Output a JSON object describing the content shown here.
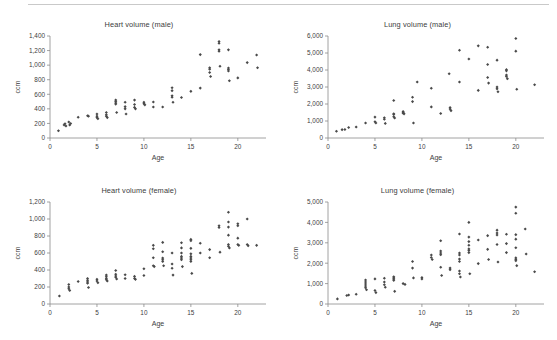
{
  "figure": {
    "background_color": "#ffffff",
    "rule_color": "#c9c9c9",
    "marker_color": "#4a4a4a",
    "axis_color": "#8c8c8c",
    "text_color": "#3c3c3c"
  },
  "panels": [
    {
      "id": "heart-male",
      "title": "Heart volume (male)",
      "xlabel": "Age",
      "ylabel": "ccm"
    },
    {
      "id": "lung-male",
      "title": "Lung volume (male)",
      "xlabel": "Age",
      "ylabel": "ccm"
    },
    {
      "id": "heart-female",
      "title": "Heart volume (female)",
      "xlabel": "Age",
      "ylabel": "ccm"
    },
    {
      "id": "lung-female",
      "title": "Lung volume (female)",
      "xlabel": "Age",
      "ylabel": "ccm"
    }
  ],
  "chart_data": [
    {
      "type": "scatter",
      "id": "heart-male",
      "title": "Heart volume (male)",
      "xlabel": "Age",
      "ylabel": "ccm",
      "xlim": [
        0,
        23
      ],
      "ylim": [
        0,
        1400
      ],
      "xticks": [
        0,
        5,
        10,
        15,
        20
      ],
      "yticks": [
        0,
        200,
        400,
        600,
        800,
        1000,
        1200,
        1400
      ],
      "ytick_labels": [
        "0",
        "200",
        "400",
        "600",
        "800",
        "1,000",
        "1,200",
        "1,400"
      ],
      "xtick_labels": [
        "0",
        "5",
        "10",
        "15",
        "20"
      ],
      "grid": false,
      "legend": "none",
      "marker": "diamond",
      "points": [
        [
          0.9,
          100
        ],
        [
          1.5,
          180
        ],
        [
          1.6,
          195
        ],
        [
          1.7,
          165
        ],
        [
          2.0,
          220
        ],
        [
          2.1,
          180
        ],
        [
          2.2,
          200
        ],
        [
          3.0,
          285
        ],
        [
          4.0,
          305
        ],
        [
          4.1,
          300
        ],
        [
          5.0,
          330
        ],
        [
          5.0,
          300
        ],
        [
          5.0,
          280
        ],
        [
          5.1,
          265
        ],
        [
          6.0,
          350
        ],
        [
          6.0,
          320
        ],
        [
          6.0,
          300
        ],
        [
          6.1,
          280
        ],
        [
          7.0,
          520
        ],
        [
          7.0,
          500
        ],
        [
          7.0,
          480
        ],
        [
          7.0,
          465
        ],
        [
          7.1,
          350
        ],
        [
          8.0,
          490
        ],
        [
          8.0,
          430
        ],
        [
          8.0,
          400
        ],
        [
          8.1,
          330
        ],
        [
          9.0,
          520
        ],
        [
          9.0,
          460
        ],
        [
          9.0,
          420
        ],
        [
          9.1,
          400
        ],
        [
          10.0,
          490
        ],
        [
          10.0,
          470
        ],
        [
          10.1,
          455
        ],
        [
          11.0,
          495
        ],
        [
          11.0,
          425
        ],
        [
          12.0,
          425
        ],
        [
          13.0,
          690
        ],
        [
          13.0,
          650
        ],
        [
          13.0,
          580
        ],
        [
          13.0,
          560
        ],
        [
          13.1,
          490
        ],
        [
          14.0,
          555
        ],
        [
          15.0,
          640
        ],
        [
          16.0,
          685
        ],
        [
          16.0,
          1145
        ],
        [
          17.0,
          965
        ],
        [
          17.0,
          945
        ],
        [
          17.0,
          900
        ],
        [
          17.1,
          845
        ],
        [
          18.0,
          1325
        ],
        [
          18.0,
          1300
        ],
        [
          18.0,
          1210
        ],
        [
          18.0,
          1190
        ],
        [
          18.1,
          985
        ],
        [
          19.0,
          1210
        ],
        [
          19.0,
          960
        ],
        [
          19.0,
          940
        ],
        [
          19.0,
          920
        ],
        [
          19.1,
          785
        ],
        [
          20.0,
          825
        ],
        [
          21.0,
          1035
        ],
        [
          22.0,
          1140
        ],
        [
          22.1,
          965
        ]
      ]
    },
    {
      "type": "scatter",
      "id": "lung-male",
      "title": "Lung volume (male)",
      "xlabel": "Age",
      "ylabel": "ccm",
      "xlim": [
        0,
        23
      ],
      "ylim": [
        0,
        6000
      ],
      "xticks": [
        0,
        5,
        10,
        15,
        20
      ],
      "yticks": [
        0,
        1000,
        2000,
        3000,
        4000,
        5000,
        6000
      ],
      "ytick_labels": [
        "0",
        "1,000",
        "2,000",
        "3,000",
        "4,000",
        "5,000",
        "6,000"
      ],
      "xtick_labels": [
        "0",
        "5",
        "10",
        "15",
        "20"
      ],
      "grid": false,
      "legend": "none",
      "marker": "diamond",
      "points": [
        [
          0.9,
          400
        ],
        [
          1.5,
          490
        ],
        [
          1.8,
          500
        ],
        [
          2.2,
          620
        ],
        [
          3.0,
          650
        ],
        [
          4.0,
          880
        ],
        [
          5.0,
          1230
        ],
        [
          5.0,
          960
        ],
        [
          5.1,
          880
        ],
        [
          6.0,
          1190
        ],
        [
          6.0,
          1100
        ],
        [
          6.1,
          860
        ],
        [
          7.0,
          2210
        ],
        [
          7.0,
          1430
        ],
        [
          7.0,
          1380
        ],
        [
          7.0,
          1250
        ],
        [
          7.1,
          1180
        ],
        [
          8.0,
          1560
        ],
        [
          8.0,
          1500
        ],
        [
          8.0,
          1460
        ],
        [
          8.1,
          1420
        ],
        [
          9.0,
          2400
        ],
        [
          9.0,
          2140
        ],
        [
          9.1,
          880
        ],
        [
          9.5,
          3290
        ],
        [
          11.0,
          2930
        ],
        [
          11.0,
          1830
        ],
        [
          12.0,
          1440
        ],
        [
          12.9,
          3780
        ],
        [
          13.0,
          1790
        ],
        [
          13.0,
          1700
        ],
        [
          13.1,
          1610
        ],
        [
          14.0,
          5160
        ],
        [
          14.0,
          3290
        ],
        [
          15.0,
          4650
        ],
        [
          16.0,
          5420
        ],
        [
          16.0,
          2800
        ],
        [
          17.0,
          5340
        ],
        [
          17.0,
          4320
        ],
        [
          17.0,
          3560
        ],
        [
          17.1,
          3230
        ],
        [
          18.0,
          4580
        ],
        [
          18.0,
          3000
        ],
        [
          18.0,
          2890
        ],
        [
          18.1,
          2720
        ],
        [
          19.0,
          4020
        ],
        [
          19.0,
          3950
        ],
        [
          19.0,
          3700
        ],
        [
          19.0,
          3620
        ],
        [
          19.1,
          3490
        ],
        [
          20.0,
          5850
        ],
        [
          20.0,
          5110
        ],
        [
          20.1,
          2870
        ],
        [
          22.0,
          3130
        ]
      ]
    },
    {
      "type": "scatter",
      "id": "heart-female",
      "title": "Heart volume (female)",
      "xlabel": "Age",
      "ylabel": "ccm",
      "xlim": [
        0,
        23
      ],
      "ylim": [
        0,
        1200
      ],
      "xticks": [
        0,
        5,
        10,
        15,
        20
      ],
      "yticks": [
        0,
        200,
        400,
        600,
        800,
        1000,
        1200
      ],
      "ytick_labels": [
        "0",
        "200",
        "400",
        "600",
        "800",
        "1,000",
        "1,200"
      ],
      "xtick_labels": [
        "0",
        "5",
        "10",
        "15",
        "20"
      ],
      "grid": false,
      "legend": "none",
      "marker": "diamond",
      "points": [
        [
          1.0,
          95
        ],
        [
          2.0,
          230
        ],
        [
          2.0,
          200
        ],
        [
          2.0,
          180
        ],
        [
          2.1,
          160
        ],
        [
          3.0,
          265
        ],
        [
          4.0,
          300
        ],
        [
          4.0,
          280
        ],
        [
          4.0,
          260
        ],
        [
          4.0,
          245
        ],
        [
          4.1,
          195
        ],
        [
          5.0,
          290
        ],
        [
          5.0,
          270
        ],
        [
          5.1,
          250
        ],
        [
          6.0,
          340
        ],
        [
          6.0,
          320
        ],
        [
          6.0,
          300
        ],
        [
          6.0,
          285
        ],
        [
          6.1,
          270
        ],
        [
          7.0,
          395
        ],
        [
          7.0,
          350
        ],
        [
          7.0,
          330
        ],
        [
          7.0,
          315
        ],
        [
          7.1,
          295
        ],
        [
          8.0,
          345
        ],
        [
          8.0,
          300
        ],
        [
          9.0,
          325
        ],
        [
          9.0,
          300
        ],
        [
          9.1,
          290
        ],
        [
          10.0,
          415
        ],
        [
          10.0,
          335
        ],
        [
          11.0,
          690
        ],
        [
          11.0,
          650
        ],
        [
          11.0,
          545
        ],
        [
          11.0,
          450
        ],
        [
          11.1,
          440
        ],
        [
          12.0,
          725
        ],
        [
          12.0,
          615
        ],
        [
          12.0,
          540
        ],
        [
          12.0,
          520
        ],
        [
          12.0,
          500
        ],
        [
          12.1,
          450
        ],
        [
          13.0,
          600
        ],
        [
          13.0,
          470
        ],
        [
          13.0,
          420
        ],
        [
          13.1,
          340
        ],
        [
          14.0,
          720
        ],
        [
          14.0,
          660
        ],
        [
          14.0,
          600
        ],
        [
          14.0,
          560
        ],
        [
          14.0,
          540
        ],
        [
          14.0,
          520
        ],
        [
          14.1,
          440
        ],
        [
          15.0,
          760
        ],
        [
          15.0,
          745
        ],
        [
          15.0,
          655
        ],
        [
          15.0,
          590
        ],
        [
          15.0,
          560
        ],
        [
          15.0,
          540
        ],
        [
          15.0,
          520
        ],
        [
          15.0,
          500
        ],
        [
          15.1,
          360
        ],
        [
          16.0,
          715
        ],
        [
          16.0,
          600
        ],
        [
          17.0,
          640
        ],
        [
          17.0,
          545
        ],
        [
          18.0,
          920
        ],
        [
          18.0,
          900
        ],
        [
          18.1,
          610
        ],
        [
          19.0,
          1080
        ],
        [
          19.0,
          965
        ],
        [
          19.0,
          905
        ],
        [
          19.0,
          810
        ],
        [
          19.0,
          700
        ],
        [
          19.0,
          680
        ],
        [
          19.1,
          660
        ],
        [
          20.0,
          945
        ],
        [
          20.0,
          920
        ],
        [
          20.0,
          775
        ],
        [
          20.0,
          700
        ],
        [
          20.1,
          690
        ],
        [
          21.0,
          1000
        ],
        [
          21.0,
          700
        ],
        [
          21.1,
          685
        ],
        [
          22.0,
          690
        ]
      ]
    },
    {
      "type": "scatter",
      "id": "lung-female",
      "title": "Lung volume (female)",
      "xlabel": "Age",
      "ylabel": "ccm",
      "xlim": [
        0,
        23
      ],
      "ylim": [
        0,
        5000
      ],
      "xticks": [
        0,
        5,
        10,
        15,
        20
      ],
      "yticks": [
        0,
        1000,
        2000,
        3000,
        4000,
        5000
      ],
      "ytick_labels": [
        "0",
        "1,000",
        "2,000",
        "3,000",
        "4,000",
        "5,000"
      ],
      "xtick_labels": [
        "0",
        "5",
        "10",
        "15",
        "20"
      ],
      "grid": false,
      "legend": "none",
      "marker": "diamond",
      "points": [
        [
          1.0,
          250
        ],
        [
          2.0,
          420
        ],
        [
          2.2,
          440
        ],
        [
          3.0,
          480
        ],
        [
          4.0,
          1180
        ],
        [
          4.0,
          1080
        ],
        [
          4.0,
          980
        ],
        [
          4.0,
          880
        ],
        [
          4.0,
          800
        ],
        [
          4.1,
          700
        ],
        [
          5.0,
          1230
        ],
        [
          5.0,
          660
        ],
        [
          5.1,
          560
        ],
        [
          6.0,
          1260
        ],
        [
          6.0,
          1080
        ],
        [
          6.0,
          940
        ],
        [
          6.1,
          820
        ],
        [
          7.0,
          1330
        ],
        [
          7.0,
          1280
        ],
        [
          7.0,
          1220
        ],
        [
          7.0,
          1160
        ],
        [
          7.1,
          620
        ],
        [
          8.0,
          1000
        ],
        [
          8.2,
          960
        ],
        [
          9.0,
          2080
        ],
        [
          9.0,
          1760
        ],
        [
          9.1,
          1280
        ],
        [
          10.0,
          1300
        ],
        [
          10.0,
          1230
        ],
        [
          11.0,
          2400
        ],
        [
          11.0,
          2280
        ],
        [
          11.1,
          2180
        ],
        [
          12.0,
          3100
        ],
        [
          12.0,
          2600
        ],
        [
          12.0,
          2500
        ],
        [
          12.0,
          2420
        ],
        [
          12.0,
          1800
        ],
        [
          12.1,
          1400
        ],
        [
          13.0,
          1760
        ],
        [
          13.0,
          1680
        ],
        [
          14.0,
          3430
        ],
        [
          14.0,
          2500
        ],
        [
          14.0,
          2400
        ],
        [
          14.0,
          2200
        ],
        [
          14.0,
          2080
        ],
        [
          14.0,
          1620
        ],
        [
          14.0,
          1480
        ],
        [
          14.1,
          1320
        ],
        [
          15.0,
          4000
        ],
        [
          15.0,
          3280
        ],
        [
          15.0,
          3060
        ],
        [
          15.0,
          2880
        ],
        [
          15.0,
          2700
        ],
        [
          15.0,
          2620
        ],
        [
          15.0,
          2520
        ],
        [
          15.1,
          1480
        ],
        [
          16.0,
          3140
        ],
        [
          16.0,
          1980
        ],
        [
          17.0,
          3350
        ],
        [
          17.0,
          2680
        ],
        [
          17.1,
          2180
        ],
        [
          18.0,
          3620
        ],
        [
          18.0,
          3480
        ],
        [
          18.0,
          3380
        ],
        [
          18.0,
          2920
        ],
        [
          18.1,
          2060
        ],
        [
          19.0,
          3420
        ],
        [
          19.0,
          2960
        ],
        [
          19.0,
          2520
        ],
        [
          20.0,
          4750
        ],
        [
          20.0,
          4450
        ],
        [
          20.0,
          3400
        ],
        [
          20.0,
          3180
        ],
        [
          20.0,
          2760
        ],
        [
          20.0,
          2260
        ],
        [
          20.0,
          2180
        ],
        [
          20.0,
          2120
        ],
        [
          20.1,
          1880
        ],
        [
          21.0,
          3680
        ],
        [
          21.1,
          2450
        ],
        [
          22.0,
          1580
        ]
      ]
    }
  ]
}
